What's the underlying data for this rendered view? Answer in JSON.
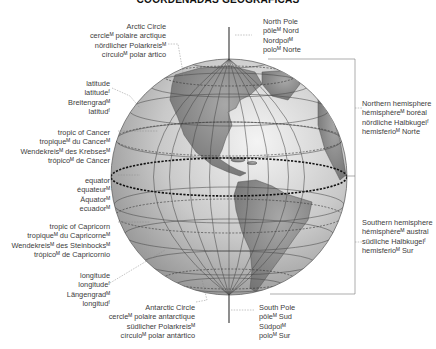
{
  "title": "COORDENADAS GEOGRÁFICAS",
  "labels": {
    "arctic_circle": [
      "Arctic Circle",
      "cercleᴹ polaire arctique",
      "nördlicher Polarkreisᴹ",
      "círculoᴹ polar ártico"
    ],
    "north_pole": [
      "North Pole",
      "pôleᴹ Nord",
      "Nordpolᴹ",
      "poloᴹ Norte"
    ],
    "latitude": [
      "latitude",
      "latitudeᶠ",
      "Breitengradᴹ",
      "latitudᶠ"
    ],
    "tropic_of_cancer": [
      "tropic of Cancer",
      "tropiqueᴹ du Cancerᴹ",
      "Wendekreisᴹ des Krebsesᴹ",
      "trópicoᴹ de Cáncer"
    ],
    "equator": [
      "equator",
      "équateurᴹ",
      "Äquatorᴹ",
      "ecuadorᴹ"
    ],
    "tropic_of_capricorn": [
      "tropic of Capricorn",
      "tropiqueᴹ du Capricorneᴹ",
      "Wendekreisᴹ des Steinbocksᴹ",
      "trópicoᴹ de Capricornio"
    ],
    "longitude": [
      "longitude",
      "longitudeᶠ",
      "Längengradᴹ",
      "longitudᶠ"
    ],
    "antarctic_circle": [
      "Antarctic Circle",
      "cercleᴹ polaire antarctique",
      "südlicher Polarkreisᴹ",
      "círculoᴹ polar antártico"
    ],
    "south_pole": [
      "South Pole",
      "pôleᴹ Sud",
      "Südpolᴹ",
      "poloᴹ Sur"
    ],
    "northern_hemisphere": [
      "Northern hemisphere",
      "hémisphèreᴹ boréal",
      "nördliche Halbkugelᶠ",
      "hemisferioᴹ Norte"
    ],
    "southern_hemisphere": [
      "Southern hemisphere",
      "hémisphèreᴹ austral",
      "südliche Halbkugelᶠ",
      "hemisferioᴹ Sur"
    ]
  },
  "colors": {
    "ocean": "#d9d9d9",
    "land": "#8a8a8a",
    "grid": "#555555",
    "text": "#3c3c3c"
  }
}
